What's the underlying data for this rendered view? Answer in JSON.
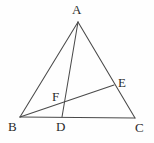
{
  "figure": {
    "kind": "geometry-diagram",
    "background_color": "#fefefe",
    "stroke_color": "#4a4a4a",
    "label_color": "#2b2b2b",
    "width": 154,
    "height": 143,
    "points": {
      "A": {
        "label": "A",
        "x": 78,
        "y": 22
      },
      "B": {
        "label": "B",
        "x": 20,
        "y": 117
      },
      "C": {
        "label": "C",
        "x": 135,
        "y": 118
      },
      "D": {
        "label": "D",
        "x": 62,
        "y": 117
      },
      "E": {
        "label": "E",
        "x": 114,
        "y": 85
      },
      "F": {
        "label": "F",
        "x": 62,
        "y": 100
      }
    },
    "segments": [
      {
        "name": "AB",
        "from": "A",
        "to": "B"
      },
      {
        "name": "AC",
        "from": "A",
        "to": "C"
      },
      {
        "name": "BC",
        "from": "B",
        "to": "C"
      },
      {
        "name": "AD",
        "from": "A",
        "to": "D"
      },
      {
        "name": "BE",
        "from": "B",
        "to": "E"
      }
    ]
  }
}
